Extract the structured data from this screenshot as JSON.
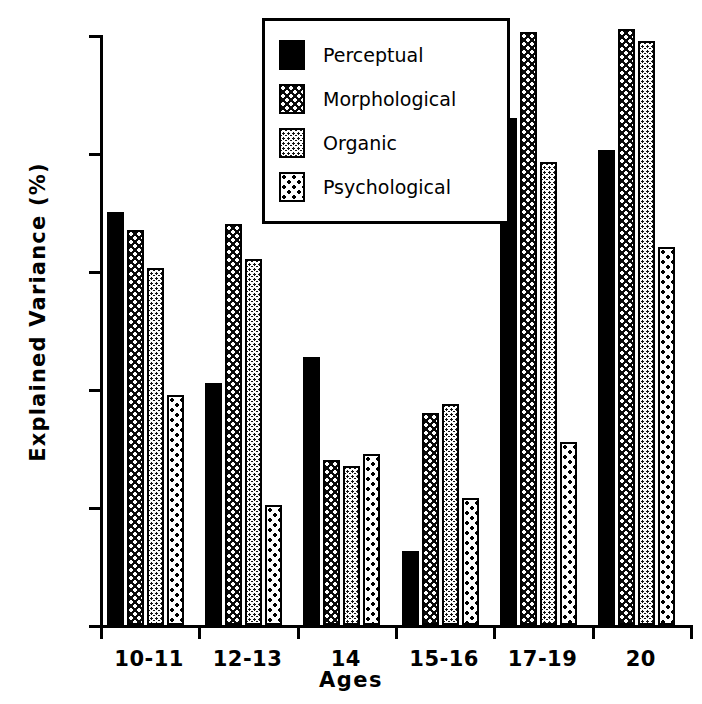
{
  "chart_data": {
    "type": "bar",
    "title": "",
    "xlabel": "Ages",
    "ylabel": "Explained Variance (%)",
    "categories": [
      "10-11",
      "12-13",
      "14",
      "15-16",
      "17-19",
      "20"
    ],
    "ylim": [
      0,
      100
    ],
    "yticks": [
      0,
      20,
      40,
      60,
      80,
      100
    ],
    "grid": false,
    "legend_position": "top-center",
    "series": [
      {
        "name": "Perceptual",
        "pattern": "solid-black",
        "values": [
          70,
          41,
          45.5,
          12.5,
          86,
          80.5
        ]
      },
      {
        "name": "Morphological",
        "pattern": "dark-white-dots",
        "values": [
          67,
          68,
          28,
          36,
          100.5,
          101
        ]
      },
      {
        "name": "Organic",
        "pattern": "dark-fine-check",
        "values": [
          60.5,
          62,
          27,
          37.5,
          78.5,
          99
        ]
      },
      {
        "name": "Psychological",
        "pattern": "white-black-dots",
        "values": [
          39,
          20.3,
          29,
          21.5,
          31,
          64
        ]
      }
    ]
  },
  "axes": {
    "y_title": "Explained Variance (%)",
    "x_title": "Ages",
    "y_tick_labels": [
      "0",
      "20",
      "40",
      "60",
      "80",
      "100"
    ],
    "x_tick_labels": [
      "10-11",
      "12-13",
      "14",
      "15-16",
      "17-19",
      "20"
    ]
  },
  "legend": {
    "items": [
      {
        "label": "Perceptual"
      },
      {
        "label": "Morphological"
      },
      {
        "label": "Organic"
      },
      {
        "label": "Psychological"
      }
    ]
  },
  "colors": {
    "ink": "#000000",
    "paper": "#ffffff"
  }
}
